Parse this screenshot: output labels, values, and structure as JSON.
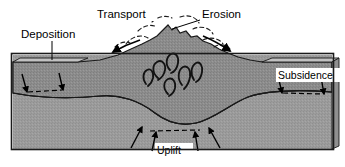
{
  "diagram": {
    "type": "geological-cross-section",
    "labels": {
      "transport": "Transport",
      "erosion": "Erosion",
      "deposition": "Deposition",
      "subsidence": "Subsidence",
      "uplift": "Uplift"
    },
    "colors": {
      "upper_crust": "#8c8c8c",
      "lower_crust": "#9a9a9a",
      "sediment_top": "#b5b5b5",
      "outline": "#1a1a1a",
      "background": "#ffffff",
      "pluton": "#1a1a1a"
    },
    "features": {
      "pluton_count": 6,
      "uplift_arrow_count": 4,
      "subsidence_arrow_count": 2,
      "deposition_arrow_count": 2,
      "transport_arrow_count": 1,
      "erosion_arrow_count": 1
    }
  }
}
